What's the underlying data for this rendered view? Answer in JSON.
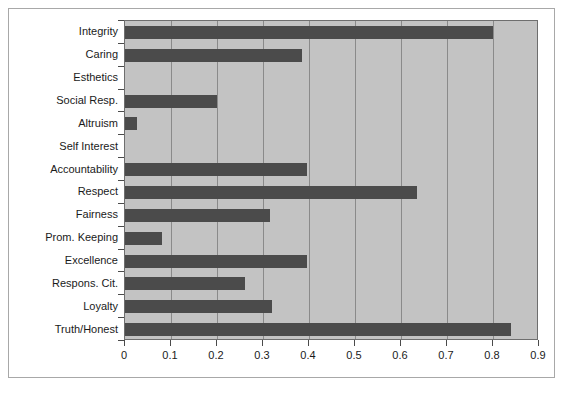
{
  "chart_data": {
    "type": "bar",
    "orientation": "horizontal",
    "title": "",
    "subtitle": "",
    "xlabel": "",
    "ylabel": "",
    "xlim": [
      0,
      0.9
    ],
    "ylim": null,
    "grid": true,
    "legend": null,
    "legend_position": "none",
    "xticks": [
      "0",
      "0.1",
      "0.2",
      "0.3",
      "0.4",
      "0.5",
      "0.6",
      "0.7",
      "0.8",
      "0.9"
    ],
    "xtick_values": [
      0,
      0.1,
      0.2,
      0.3,
      0.4,
      0.5,
      0.6,
      0.7,
      0.8,
      0.9
    ],
    "categories": [
      "Integrity",
      "Caring",
      "Esthetics",
      "Social Resp.",
      "Altruism",
      "Self Interest",
      "Accountability",
      "Respect",
      "Fairness",
      "Prom. Keeping",
      "Excellence",
      "Respons. Cit.",
      "Loyalty",
      "Truth/Honest"
    ],
    "values": [
      0.8,
      0.385,
      0.0,
      0.2,
      0.025,
      0.0,
      0.395,
      0.635,
      0.315,
      0.08,
      0.395,
      0.26,
      0.32,
      0.84
    ],
    "colors": {
      "bar": "#4b4b4b",
      "plot_background": "#c3c3c3",
      "gridline": "#8a8a8a",
      "axis": "#4a4a4a",
      "frame": "#a8a8a8",
      "figure_background": "#ffffff",
      "text": "#1a1a1a"
    }
  }
}
